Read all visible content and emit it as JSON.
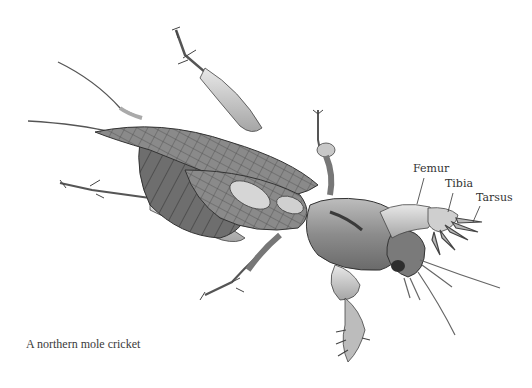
{
  "figure": {
    "labels": [
      {
        "id": "femur",
        "text": "Femur"
      },
      {
        "id": "tibia",
        "text": "Tibia"
      },
      {
        "id": "tarsus",
        "text": "Tarsus"
      }
    ],
    "caption": "A northern mole cricket",
    "colors": {
      "background": "#ffffff",
      "ink": "#333333",
      "body_shade": "#9a9a9a",
      "dark_shade": "#5a5a5a",
      "light_shade": "#d8d8d8"
    }
  }
}
